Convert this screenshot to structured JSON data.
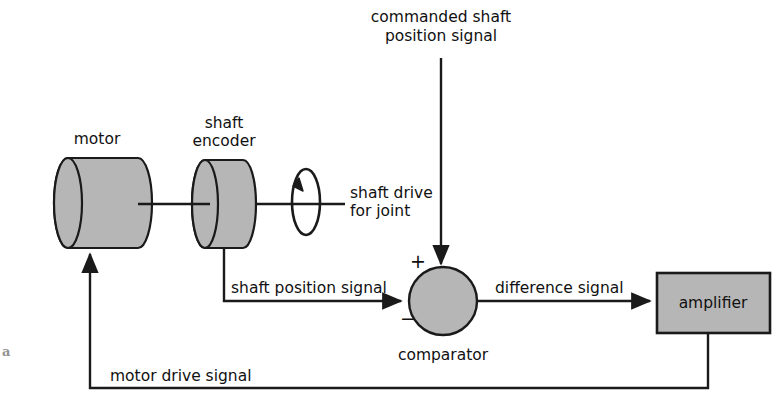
{
  "figure": {
    "corner_mark": "a",
    "colors": {
      "shape_fill": "#b6b6b6",
      "stroke": "#1a1a1a",
      "text": "#111111",
      "background": "#ffffff"
    }
  },
  "blocks": {
    "motor": {
      "label": "motor",
      "shape": "cylinder"
    },
    "shaft_encoder": {
      "label": "shaft\nencoder",
      "label_line1": "shaft",
      "label_line2": "encoder",
      "shape": "cylinder"
    },
    "comparator": {
      "label": "comparator",
      "shape": "circle",
      "plus_sign": "+",
      "minus_sign": "−"
    },
    "amplifier": {
      "label": "amplifier",
      "shape": "rectangle"
    }
  },
  "signals": {
    "commanded": {
      "label_line1": "commanded shaft",
      "label_line2": "position signal"
    },
    "shaft_drive": {
      "label_line1": "shaft drive",
      "label_line2": "for joint"
    },
    "shaft_position": {
      "label": "shaft position signal"
    },
    "difference": {
      "label": "difference signal"
    },
    "motor_drive": {
      "label": "motor drive signal"
    }
  },
  "icons": {
    "rotation": "rotation-arrow-icon"
  }
}
